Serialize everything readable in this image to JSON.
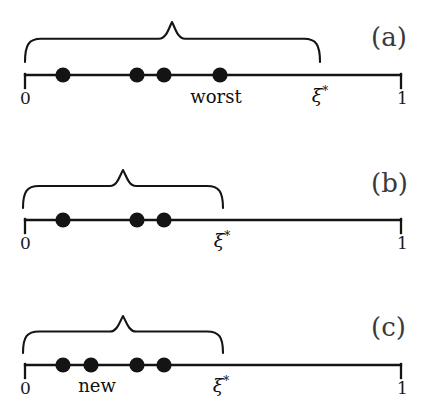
{
  "figure": {
    "background_color": "#ffffff",
    "ink_color": "#141414",
    "width": 435,
    "height": 414,
    "axis": {
      "x_start": 25,
      "x_end": 401,
      "left_tick_label": "0",
      "right_tick_label": "1"
    },
    "panels": [
      {
        "id": "a",
        "letter": "(a)",
        "letter_x": 395,
        "letter_y": 40,
        "axis_y": 75,
        "brace": {
          "x_start": 25,
          "x_end": 320,
          "peak_x": 172,
          "top_y": 22,
          "bottom_y": 62
        },
        "points": [
          {
            "x": 63,
            "value": 0.1
          },
          {
            "x": 137,
            "value": 0.3
          },
          {
            "x": 164,
            "value": 0.37
          },
          {
            "x": 220,
            "value": 0.52
          }
        ],
        "annotations": [
          {
            "text": "worst",
            "x": 216,
            "y": 88,
            "kind": "word"
          },
          {
            "text": "ξ",
            "sup": "*",
            "x": 320,
            "y": 86,
            "kind": "xi"
          }
        ]
      },
      {
        "id": "b",
        "letter": "(b)",
        "letter_x": 395,
        "letter_y": 186,
        "axis_y": 220,
        "brace": {
          "x_start": 23,
          "x_end": 223,
          "peak_x": 123,
          "top_y": 170,
          "bottom_y": 208
        },
        "points": [
          {
            "x": 63,
            "value": 0.1
          },
          {
            "x": 137,
            "value": 0.3
          },
          {
            "x": 164,
            "value": 0.37
          }
        ],
        "annotations": [
          {
            "text": "ξ",
            "sup": "*",
            "x": 222,
            "y": 231,
            "kind": "xi"
          }
        ]
      },
      {
        "id": "c",
        "letter": "(c)",
        "letter_x": 395,
        "letter_y": 330,
        "axis_y": 365,
        "brace": {
          "x_start": 23,
          "x_end": 223,
          "peak_x": 123,
          "top_y": 316,
          "bottom_y": 353
        },
        "points": [
          {
            "x": 63,
            "value": 0.1
          },
          {
            "x": 91,
            "value": 0.175
          },
          {
            "x": 137,
            "value": 0.3
          },
          {
            "x": 164,
            "value": 0.37
          }
        ],
        "annotations": [
          {
            "text": "new",
            "x": 97,
            "y": 377,
            "kind": "word"
          },
          {
            "text": "ξ",
            "sup": "*",
            "x": 221,
            "y": 376,
            "kind": "xi"
          }
        ]
      }
    ]
  },
  "chart_data": {
    "type": "scatter",
    "title": "",
    "xlabel": "",
    "ylabel": "",
    "xlim": [
      0,
      1
    ],
    "grid": false,
    "legend": "none",
    "series": [
      {
        "name": "(a) current points",
        "x": [
          0.1,
          0.3,
          0.37,
          0.52
        ],
        "bracket": [
          0.0,
          0.785
        ],
        "bracket_peak": 0.39,
        "annotations": [
          "worst at 0.52",
          "ξ* at 0.785"
        ]
      },
      {
        "name": "(b) after removal",
        "x": [
          0.1,
          0.3,
          0.37
        ],
        "bracket": [
          0.0,
          0.527
        ],
        "bracket_peak": 0.26,
        "annotations": [
          "ξ* at 0.527"
        ]
      },
      {
        "name": "(c) after insertion",
        "x": [
          0.1,
          0.175,
          0.3,
          0.37
        ],
        "bracket": [
          0.0,
          0.527
        ],
        "bracket_peak": 0.26,
        "annotations": [
          "new at 0.175",
          "ξ* at 0.527"
        ]
      }
    ]
  }
}
